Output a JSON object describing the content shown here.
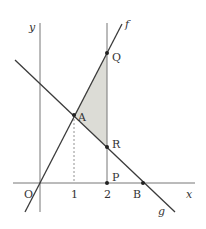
{
  "diagram": {
    "axes": {
      "x_label": "x",
      "y_label": "y",
      "origin_label": "O"
    },
    "ticks": {
      "x1": "1",
      "x2": "2"
    },
    "lines": {
      "f": "f",
      "g": "g"
    },
    "points": {
      "A": "A",
      "Q": "Q",
      "R": "R",
      "P": "P",
      "B": "B"
    },
    "colors": {
      "line": "#3a3a3a",
      "axis": "#777777",
      "shade": "#dcdcd6"
    }
  }
}
